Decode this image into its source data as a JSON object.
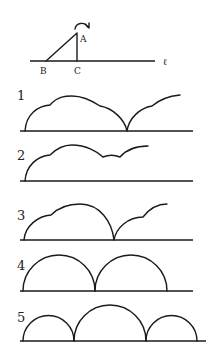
{
  "setup": {
    "points": {
      "A": "A",
      "B": "B",
      "C": "C"
    },
    "line_label": "ℓ",
    "rotation_icon": "clockwise-arrow-icon"
  },
  "options": [
    {
      "label": "1",
      "description": "cloud-like curve with small cusps, cusp to baseline, then partial rising arc"
    },
    {
      "label": "2",
      "description": "cloud-like curve with small cusps, dipping but not reaching baseline, ends mid-height"
    },
    {
      "label": "3",
      "description": "two-segment arc with small cusp, touching baseline, then partial arc with cusp"
    },
    {
      "label": "4",
      "description": "two equal semicircular arcs"
    },
    {
      "label": "5",
      "description": "three arcs: small, large, small"
    }
  ]
}
